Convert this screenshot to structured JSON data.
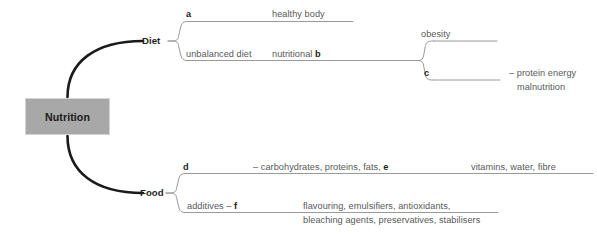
{
  "diagram": {
    "type": "mind-map",
    "root": {
      "label": "Nutrition"
    },
    "branches": [
      {
        "id": "diet",
        "label": "Diet",
        "children": [
          {
            "id": "diet-a",
            "blank": "a",
            "text": "healthy body"
          },
          {
            "id": "diet-b",
            "lead": "unbalanced diet",
            "text_before_blank": "nutritional ",
            "blank": "b",
            "children": [
              {
                "id": "obesity",
                "text": "obesity"
              },
              {
                "id": "pem",
                "blank": "c",
                "text": "– protein energy",
                "text_line2": "malnutrition"
              }
            ]
          }
        ]
      },
      {
        "id": "food",
        "label": "Food",
        "children": [
          {
            "id": "food-d",
            "blank": "d",
            "text_before_blank": "– carbohydrates, proteins, fats, ",
            "blank2": "e",
            "tail": "vitamins, water, fibre"
          },
          {
            "id": "food-f",
            "lead_before_blank": "additives – ",
            "blank": "f",
            "text": "flavouring, emulsifiers, antioxidants,",
            "text_line2": "bleaching agents, preservatives, stabilisers"
          }
        ]
      }
    ]
  },
  "colors": {
    "root_fill": "#a8a8a8",
    "root_border": "#d4d4d4",
    "root_text": "#1a1a1a",
    "branch_stroke": "#1a1a1a",
    "leaf_stroke": "#9a9a9c",
    "body_text": "#58585a",
    "blank_text": "#231f20",
    "background": "#ffffff"
  }
}
